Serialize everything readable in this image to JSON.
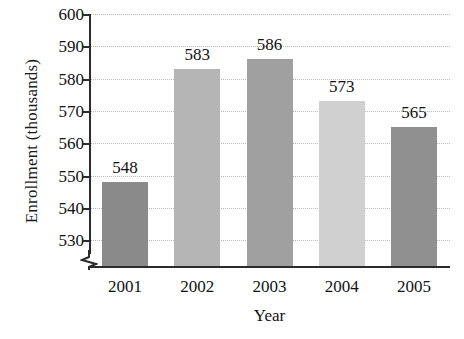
{
  "chart_data": {
    "type": "bar",
    "title": "",
    "xlabel": "Year",
    "ylabel": "Enrollment (thousands)",
    "categories": [
      "2001",
      "2002",
      "2003",
      "2004",
      "2005"
    ],
    "values": [
      548,
      583,
      586,
      573,
      565
    ],
    "value_labels": [
      "548",
      "583",
      "586",
      "573",
      "565"
    ],
    "ylim": [
      522,
      600
    ],
    "yticks": [
      600,
      590,
      580,
      570,
      560,
      550,
      540,
      530
    ],
    "ytick_labels": [
      "600",
      "590",
      "580",
      "570",
      "560",
      "550",
      "540",
      "530"
    ],
    "grid": true,
    "grid_style": "dotted",
    "legend": false,
    "axis_break": true,
    "axis_break_note": "y-axis broken below 530",
    "bar_colors": [
      "#8a8a8a",
      "#b5b5b5",
      "#a0a0a0",
      "#d0d0d0",
      "#909090"
    ],
    "grid_color": "#b9b9b9",
    "axis_color": "#2b2b2b",
    "text_color": "#111111",
    "background": "#ffffff"
  }
}
